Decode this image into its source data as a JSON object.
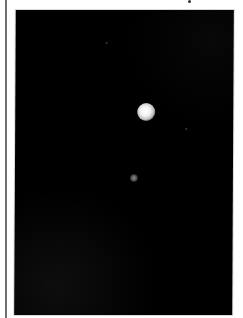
{
  "image": {
    "subject": "astronomical photograph: bright object with faint companion on black sky",
    "background_color": "#000000",
    "page_color": "#ffffff",
    "primary_object": {
      "label": "bright-object",
      "center_x": 146,
      "center_y": 112,
      "diameter": 18,
      "color": "#ffffff"
    },
    "secondary_object": {
      "label": "faint-object",
      "center_x": 134,
      "center_y": 178,
      "diameter": 8,
      "color": "#7a7a7a"
    }
  }
}
